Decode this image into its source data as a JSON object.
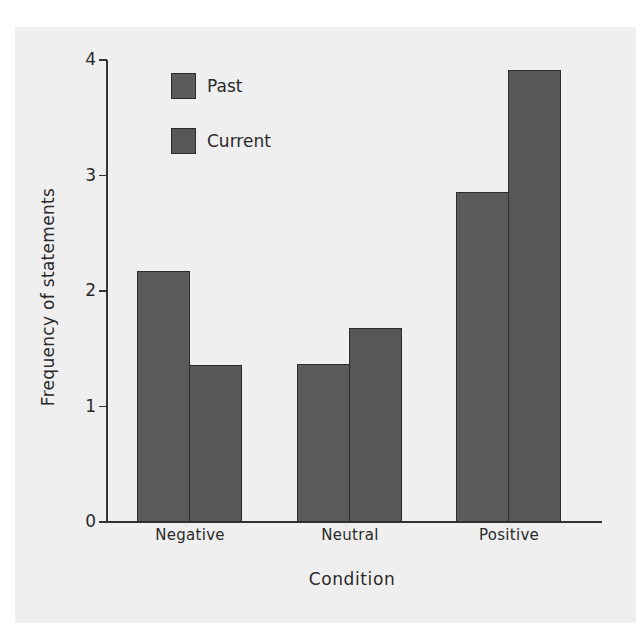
{
  "chart_data": {
    "type": "bar",
    "title": "",
    "xlabel": "Condition",
    "ylabel": "Frequency of statements",
    "categories": [
      "Negative",
      "Neutral",
      "Positive"
    ],
    "series": [
      {
        "name": "Past",
        "values": [
          2.17,
          1.37,
          2.86
        ],
        "color": "#5b5b5b"
      },
      {
        "name": "Current",
        "values": [
          1.36,
          1.68,
          3.91
        ],
        "color": "#575757"
      }
    ],
    "ylim": [
      0,
      4
    ],
    "yticks": [
      "0",
      "1",
      "2",
      "3",
      "4"
    ],
    "grid": false,
    "legend_position": "upper-left-inside"
  },
  "colors": {
    "card_background": "#efefef",
    "axis": "#333333"
  }
}
